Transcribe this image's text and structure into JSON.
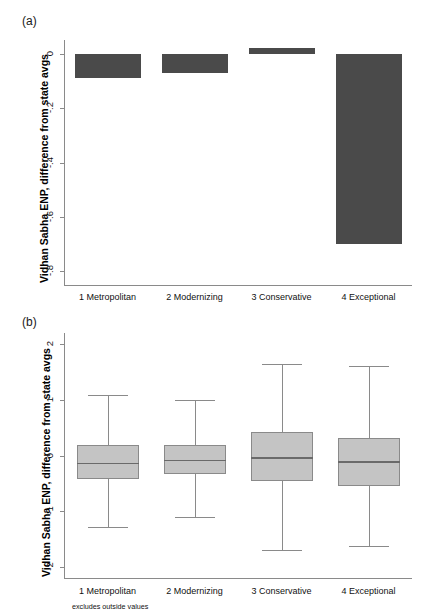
{
  "figure": {
    "panels": [
      {
        "letter": "(a)",
        "ylabel": "Vidhan Sabha ENP, difference from state avgs"
      },
      {
        "letter": "(b)",
        "ylabel": "Vidhan Sabha ENP, difference from state avgs",
        "note": "excludes outside values"
      }
    ]
  },
  "chart_data": [
    {
      "type": "bar",
      "panel": "(a)",
      "title": "",
      "xlabel": "",
      "ylabel": "Vidhan Sabha ENP, difference from state avgs",
      "categories": [
        "1 Metropolitan",
        "2 Modernizing",
        "3 Conservative",
        "4 Exceptional"
      ],
      "values": [
        -0.09,
        -0.07,
        0.02,
        -0.7
      ],
      "ylim": [
        -0.85,
        0.05
      ],
      "yticks": [
        0,
        -0.2,
        -0.4,
        -0.6,
        -0.8
      ],
      "yticklabels": [
        "0",
        "-.2",
        "-.4",
        "-.6",
        "-.8"
      ],
      "grid": false,
      "legend": "none",
      "bar_color": "#4a4a4a"
    },
    {
      "type": "box",
      "panel": "(b)",
      "title": "",
      "xlabel": "",
      "ylabel": "Vidhan Sabha ENP, difference from state avgs",
      "categories": [
        "1 Metropolitan",
        "2 Modernizing",
        "3 Conservative",
        "4 Exceptional"
      ],
      "ylim": [
        -2.2,
        2.2
      ],
      "yticks": [
        2,
        1,
        0,
        -1,
        -2
      ],
      "yticklabels": [
        "2",
        "1",
        "0",
        "-1",
        "-2"
      ],
      "grid": false,
      "legend": "none",
      "box_fill": "#c4c4c4",
      "box_edge": "#8a8a8a",
      "note": "excludes outside values",
      "boxes": [
        {
          "category": "1 Metropolitan",
          "whisker_low": -1.28,
          "q1": -0.42,
          "median": -0.13,
          "q3": 0.18,
          "whisker_high": 1.08
        },
        {
          "category": "2 Modernizing",
          "whisker_low": -1.1,
          "q1": -0.33,
          "median": -0.08,
          "q3": 0.18,
          "whisker_high": 0.99
        },
        {
          "category": "3 Conservative",
          "whisker_low": -1.69,
          "q1": -0.45,
          "median": -0.03,
          "q3": 0.42,
          "whisker_high": 1.64
        },
        {
          "category": "4 Exceptional",
          "whisker_low": -1.62,
          "q1": -0.54,
          "median": -0.1,
          "q3": 0.32,
          "whisker_high": 1.61
        }
      ]
    }
  ]
}
